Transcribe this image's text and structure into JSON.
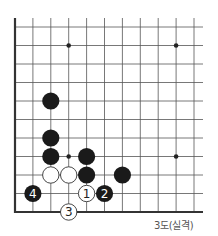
{
  "diagram": {
    "caption": "3도(실격)",
    "board": {
      "origin_x": 15,
      "origin_y": 27,
      "col_spacing": 17.9,
      "row_spacing": 18.5,
      "cols": 11,
      "rows": 11,
      "left_edge": true,
      "bottom_edge": true,
      "line_top": 18,
      "line_right": 203,
      "line_color": "#555555",
      "edge_color": "#333333"
    },
    "hoshi": [
      {
        "col": 3,
        "row": 1
      },
      {
        "col": 9,
        "row": 1
      },
      {
        "col": 3,
        "row": 7
      },
      {
        "col": 9,
        "row": 7
      }
    ],
    "stones": [
      {
        "color": "black",
        "col": 2,
        "row": 4,
        "label": ""
      },
      {
        "color": "black",
        "col": 2,
        "row": 6,
        "label": ""
      },
      {
        "color": "black",
        "col": 2,
        "row": 7,
        "label": ""
      },
      {
        "color": "black",
        "col": 4,
        "row": 7,
        "label": ""
      },
      {
        "color": "black",
        "col": 4,
        "row": 8,
        "label": ""
      },
      {
        "color": "black",
        "col": 6,
        "row": 8,
        "label": ""
      },
      {
        "color": "white",
        "col": 2,
        "row": 8,
        "label": ""
      },
      {
        "color": "white",
        "col": 3,
        "row": 8,
        "label": ""
      },
      {
        "color": "white",
        "col": 4,
        "row": 9,
        "label": "1"
      },
      {
        "color": "black",
        "col": 5,
        "row": 9,
        "label": "2"
      },
      {
        "color": "white",
        "col": 3,
        "row": 10,
        "label": "3"
      },
      {
        "color": "black",
        "col": 1,
        "row": 9,
        "label": "4"
      }
    ],
    "colors": {
      "black_stone": "#1a1a1a",
      "white_stone": "#ffffff",
      "white_stone_outline": "#333333",
      "hoshi": "#222222"
    }
  }
}
